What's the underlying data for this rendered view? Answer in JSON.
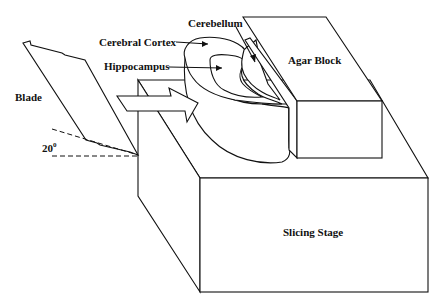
{
  "diagram": {
    "type": "brain-slice-apparatus-schematic",
    "labels": {
      "cerebellum": "Cerebellum",
      "cerebral_cortex": "Cerebral Cortex",
      "hippocampus": "Hippocampus",
      "agar_block": "Agar Block",
      "blade": "Blade",
      "angle": "20",
      "angle_unit": "0",
      "slicing_stage": "Slicing Stage"
    },
    "colors": {
      "line": "#111111",
      "background": "#ffffff"
    }
  }
}
